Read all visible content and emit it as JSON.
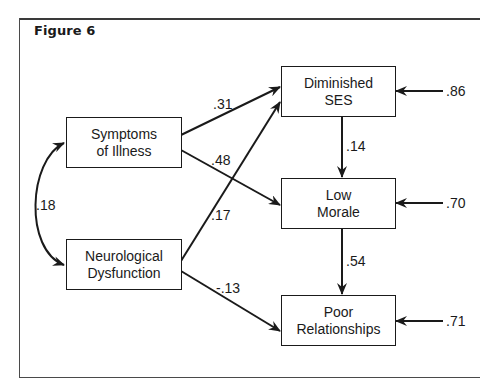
{
  "figure": {
    "title": "Figure 6"
  },
  "nodes": {
    "symptoms": {
      "line1": "Symptoms",
      "line2": "of Illness"
    },
    "neuro": {
      "line1": "Neurological",
      "line2": "Dysfunction"
    },
    "ses": {
      "line1": "Diminished",
      "line2": "SES"
    },
    "morale": {
      "line1": "Low",
      "line2": "Morale"
    },
    "poor": {
      "line1": "Poor",
      "line2": "Relationships"
    }
  },
  "paths": {
    "symptoms_ses": ".31",
    "symptoms_morale": ".48",
    "neuro_ses": ".17",
    "neuro_poor": "-.13",
    "ses_morale": ".14",
    "morale_poor": ".54",
    "symptoms_neuro_correlation": ".18"
  },
  "residuals": {
    "ses": ".86",
    "morale": ".70",
    "poor": ".71"
  },
  "colors": {
    "line": "#1a1a1a",
    "frame": "#3a3a3a",
    "background": "#ffffff"
  }
}
